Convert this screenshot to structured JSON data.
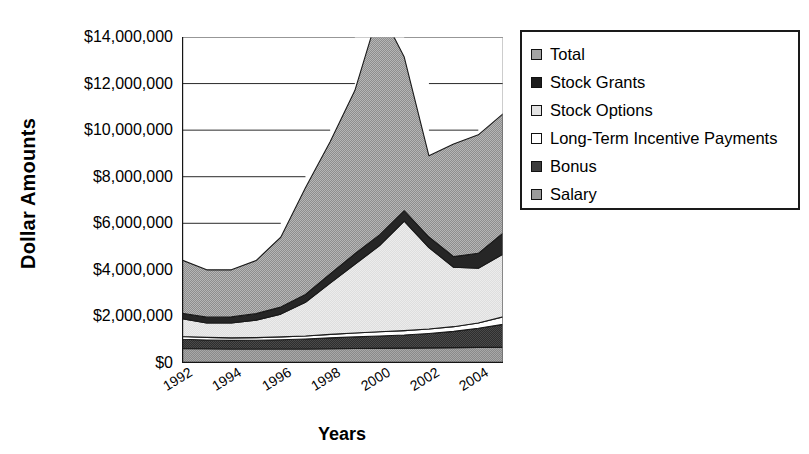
{
  "chart_data": {
    "type": "area",
    "title": "",
    "xlabel": "Years",
    "ylabel": "Dollar Amounts",
    "stacked": true,
    "grid": true,
    "legend_position": "right",
    "xlim": [
      1992,
      2005
    ],
    "ylim": [
      0,
      14000000
    ],
    "ytick_labels": [
      "$14,000,000",
      "$12,000,000",
      "$10,000,000",
      "$8,000,000",
      "$6,000,000",
      "$4,000,000",
      "$2,000,000",
      "$0"
    ],
    "ytick_values": [
      14000000,
      12000000,
      10000000,
      8000000,
      6000000,
      4000000,
      2000000,
      0
    ],
    "xtick_labels": [
      "1992",
      "1994",
      "1996",
      "1998",
      "2000",
      "2002",
      "2004"
    ],
    "xtick_values": [
      1992,
      1994,
      1996,
      1998,
      2000,
      2002,
      2004
    ],
    "x": [
      1992,
      1993,
      1994,
      1995,
      1996,
      1997,
      1998,
      1999,
      2000,
      2001,
      2002,
      2003,
      2004,
      2005
    ],
    "series": [
      {
        "name": "Salary",
        "color": "#9a9a9a",
        "values": [
          620000,
          610000,
          600000,
          600000,
          600000,
          600000,
          610000,
          620000,
          630000,
          640000,
          650000,
          660000,
          670000,
          680000
        ]
      },
      {
        "name": "Bonus",
        "color": "#3d3d3d",
        "values": [
          400000,
          380000,
          370000,
          380000,
          400000,
          430000,
          470000,
          500000,
          530000,
          560000,
          620000,
          700000,
          820000,
          980000
        ]
      },
      {
        "name": "Long-Term Incentive Payments",
        "color": "#ffffff",
        "values": [
          120000,
          110000,
          110000,
          110000,
          120000,
          130000,
          150000,
          170000,
          180000,
          190000,
          190000,
          200000,
          230000,
          320000
        ]
      },
      {
        "name": "Stock Options",
        "color": "#e8e8e8",
        "values": [
          760000,
          620000,
          640000,
          750000,
          980000,
          1450000,
          2200000,
          2950000,
          3700000,
          4700000,
          3500000,
          2550000,
          2350000,
          2700000
        ]
      },
      {
        "name": "Stock Grants",
        "color": "#2a2a2a",
        "values": [
          240000,
          250000,
          260000,
          280000,
          300000,
          330000,
          400000,
          450000,
          460000,
          450000,
          450000,
          460000,
          640000,
          900000
        ]
      },
      {
        "name": "Total",
        "color": "#a3a3a3",
        "values": [
          2280000,
          2030000,
          2020000,
          2280000,
          3000000,
          4590000,
          5670000,
          7010000,
          9700000,
          6600000,
          3490000,
          4830000,
          5090000,
          5120000
        ]
      }
    ],
    "total_line": [
      4420000,
      4000000,
      4000000,
      4400000,
      5400000,
      7530000,
      9500000,
      11700000,
      15200000,
      13140000,
      8900000,
      9400000,
      10800000,
      10700000
    ],
    "total_top_observed": [
      4420000,
      4000000,
      4000000,
      4400000,
      5400000,
      7530000,
      9500000,
      11700000,
      13180000,
      11800000,
      9900000,
      8950000,
      9800000,
      10700000
    ]
  },
  "axis": {
    "ylabel": "Dollar Amounts",
    "xlabel": "Years"
  },
  "legend": {
    "items": [
      {
        "label": "Total",
        "swatch": "legend-swatch-total",
        "fill": "#a3a3a3"
      },
      {
        "label": "Stock Grants",
        "swatch": "legend-swatch-stock-grants",
        "fill": "#1c1c1c"
      },
      {
        "label": "Stock Options",
        "swatch": "legend-swatch-stock-options",
        "fill": "#e3e3e3"
      },
      {
        "label": "Long-Term Incentive Payments",
        "swatch": "legend-swatch-ltip",
        "fill": "#ffffff"
      },
      {
        "label": "Bonus",
        "swatch": "legend-swatch-bonus",
        "fill": "#3d3d3d"
      },
      {
        "label": "Salary",
        "swatch": "legend-swatch-salary",
        "fill": "#9a9a9a"
      }
    ]
  }
}
